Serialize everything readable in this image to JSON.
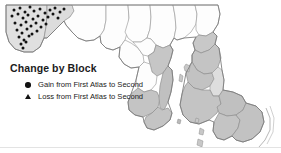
{
  "figure": {
    "kind": "choropleth-map",
    "background_color": "#ffffff"
  },
  "legend": {
    "title": "Change by Block",
    "entries": [
      {
        "symbol": "circle",
        "marker_name": "gain-circle-marker",
        "label": "Gain from First Atlas to Second"
      },
      {
        "symbol": "triangle",
        "marker_name": "loss-triangle-marker",
        "label": "Loss from First Atlas to Second"
      }
    ]
  },
  "map": {
    "outline_color": "#8c8c8c",
    "county_line_color": "#9a9a9a",
    "fill_unshaded": "#fdfdfd",
    "fill_light": "#e2e2e2",
    "fill_medium": "#c9c9c9",
    "fill_dark": "#b4b4b4",
    "marker_color": "#121212",
    "regions": [
      {
        "name": "garrett",
        "shade": "light"
      },
      {
        "name": "allegany",
        "shade": "light"
      },
      {
        "name": "washington",
        "shade": "unshaded"
      },
      {
        "name": "frederick",
        "shade": "unshaded"
      },
      {
        "name": "carroll",
        "shade": "unshaded"
      },
      {
        "name": "baltimore",
        "shade": "unshaded"
      },
      {
        "name": "harford",
        "shade": "unshaded"
      },
      {
        "name": "cecil",
        "shade": "unshaded"
      },
      {
        "name": "montgomery",
        "shade": "unshaded"
      },
      {
        "name": "howard",
        "shade": "unshaded"
      },
      {
        "name": "anne-arundel",
        "shade": "medium"
      },
      {
        "name": "prince-georges",
        "shade": "unshaded"
      },
      {
        "name": "charles",
        "shade": "medium"
      },
      {
        "name": "calvert",
        "shade": "medium"
      },
      {
        "name": "st-marys",
        "shade": "medium"
      },
      {
        "name": "kent",
        "shade": "medium"
      },
      {
        "name": "queen-annes",
        "shade": "medium"
      },
      {
        "name": "talbot",
        "shade": "medium"
      },
      {
        "name": "caroline",
        "shade": "light"
      },
      {
        "name": "dorchester",
        "shade": "medium"
      },
      {
        "name": "wicomico",
        "shade": "medium"
      },
      {
        "name": "somerset",
        "shade": "medium"
      },
      {
        "name": "worcester",
        "shade": "medium"
      }
    ],
    "gain_markers": [
      [
        14,
        10
      ],
      [
        20,
        8
      ],
      [
        25,
        12
      ],
      [
        30,
        7
      ],
      [
        34,
        11
      ],
      [
        40,
        9
      ],
      [
        45,
        13
      ],
      [
        50,
        10
      ],
      [
        55,
        8
      ],
      [
        60,
        12
      ],
      [
        64,
        9
      ],
      [
        12,
        16
      ],
      [
        18,
        14
      ],
      [
        23,
        18
      ],
      [
        28,
        15
      ],
      [
        33,
        19
      ],
      [
        38,
        16
      ],
      [
        43,
        20
      ],
      [
        48,
        17
      ],
      [
        53,
        14
      ],
      [
        58,
        18
      ],
      [
        15,
        23
      ],
      [
        21,
        25
      ],
      [
        26,
        22
      ],
      [
        31,
        26
      ],
      [
        36,
        23
      ],
      [
        41,
        27
      ],
      [
        46,
        24
      ],
      [
        17,
        30
      ],
      [
        22,
        33
      ],
      [
        27,
        29
      ],
      [
        32,
        34
      ],
      [
        37,
        31
      ],
      [
        19,
        37
      ],
      [
        24,
        40
      ],
      [
        29,
        36
      ],
      [
        21,
        44
      ],
      [
        26,
        42
      ],
      [
        23,
        48
      ]
    ],
    "marker_counts": {
      "gain": 39,
      "loss": 0
    }
  }
}
